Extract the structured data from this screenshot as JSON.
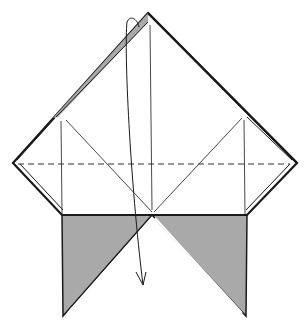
{
  "diagram": {
    "type": "origami-fold-step",
    "colors": {
      "paper_front": "#ffffff",
      "paper_back": "#a9a9a9",
      "line": "#1a1a1a"
    },
    "elements": [
      {
        "id": "outline",
        "kind": "polygon-outline"
      },
      {
        "id": "valley-fold-line",
        "kind": "dashed-line",
        "label": "valley fold"
      },
      {
        "id": "left-flap",
        "kind": "gray-triangle"
      },
      {
        "id": "right-flap",
        "kind": "gray-triangle"
      },
      {
        "id": "fold-arrow",
        "kind": "curved-arrow",
        "label": "fold top point down"
      }
    ]
  }
}
